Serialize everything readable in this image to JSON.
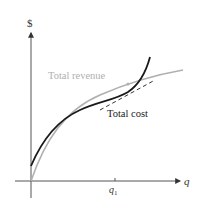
{
  "diagram": {
    "y_axis_label": "$",
    "x_axis_label": "q",
    "x_tick_label": "q",
    "x_tick_subscript": "1",
    "curves": [
      {
        "name": "Total revenue",
        "color": "#b0b0b0"
      },
      {
        "name": "Total cost",
        "color": "#1a1a1a"
      }
    ],
    "tangent_line": {
      "style": "dashed",
      "color": "#333333"
    }
  },
  "labels": {
    "total_revenue": "Total revenue",
    "total_cost": "Total cost"
  }
}
